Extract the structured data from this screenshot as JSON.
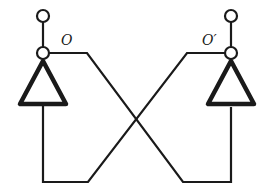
{
  "diagram": {
    "type": "cross-coupled inverter pair (flip-flop)",
    "nodes": {
      "left_output": {
        "label": "O"
      },
      "right_output": {
        "label": "O′"
      }
    },
    "elements": [
      {
        "name": "left-inverter",
        "shape": "triangle",
        "orientation": "up"
      },
      {
        "name": "right-inverter",
        "shape": "triangle",
        "orientation": "up"
      },
      {
        "name": "left-top-terminal",
        "shape": "open-circle"
      },
      {
        "name": "left-output-node",
        "shape": "open-circle"
      },
      {
        "name": "right-top-terminal",
        "shape": "open-circle"
      },
      {
        "name": "right-output-node",
        "shape": "open-circle"
      }
    ],
    "connections": [
      "O output → crosses over → input of right inverter",
      "O′ output → crosses over → input of left inverter"
    ],
    "colors": {
      "stroke": "#1a1a1a",
      "background": "#ffffff"
    }
  }
}
